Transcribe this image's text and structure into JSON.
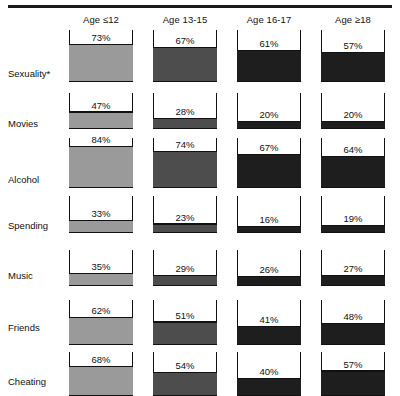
{
  "chart_data": {
    "type": "bar",
    "title": "",
    "subtitle": "",
    "xlabel": "",
    "ylabel": "",
    "ylim": [
      0,
      100
    ],
    "grid": false,
    "legend": "none",
    "note": "Small-multiples tank chart: each cell is an open-topped vessel filled from the bottom to the stated percentage.",
    "categories": [
      "Age ≤12",
      "Age 13-15",
      "Age 16-17",
      "Age ≥18"
    ],
    "row_labels": [
      "Sexuality*",
      "Movies",
      "Alcohol",
      "Spending",
      "Music",
      "Friends",
      "Cheating"
    ],
    "series": [
      {
        "name": "Sexuality*",
        "values": [
          73,
          67,
          61,
          57
        ]
      },
      {
        "name": "Movies",
        "values": [
          47,
          28,
          20,
          20
        ]
      },
      {
        "name": "Alcohol",
        "values": [
          84,
          74,
          67,
          64
        ]
      },
      {
        "name": "Spending",
        "values": [
          33,
          23,
          16,
          19
        ]
      },
      {
        "name": "Music",
        "values": [
          35,
          29,
          26,
          27
        ]
      },
      {
        "name": "Friends",
        "values": [
          62,
          51,
          41,
          48
        ]
      },
      {
        "name": "Cheating",
        "values": [
          68,
          54,
          40,
          57
        ]
      }
    ],
    "value_labels": [
      [
        "73%",
        "67%",
        "61%",
        "57%"
      ],
      [
        "47%",
        "28%",
        "20%",
        "20%"
      ],
      [
        "84%",
        "74%",
        "67%",
        "64%"
      ],
      [
        "33%",
        "23%",
        "16%",
        "19%"
      ],
      [
        "35%",
        "29%",
        "26%",
        "27%"
      ],
      [
        "62%",
        "51%",
        "41%",
        "48%"
      ],
      [
        "68%",
        "54%",
        "40%",
        "57%"
      ]
    ],
    "column_colors": [
      "#9a9a9a",
      "#4d4d4d",
      "#1e1e1e",
      "#1e1e1e"
    ],
    "outline_color": "#111111"
  },
  "header": {
    "columns": [
      {
        "label": "Age ≤12"
      },
      {
        "label": "Age 13-15"
      },
      {
        "label": "Age 16-17"
      },
      {
        "label": "Age ≥18"
      }
    ]
  },
  "rows": [
    {
      "label": "Sexuality*",
      "cells": [
        {
          "value": 73,
          "text": "73%"
        },
        {
          "value": 67,
          "text": "67%"
        },
        {
          "value": 61,
          "text": "61%"
        },
        {
          "value": 57,
          "text": "57%"
        }
      ]
    },
    {
      "label": "Movies",
      "cells": [
        {
          "value": 47,
          "text": "47%"
        },
        {
          "value": 28,
          "text": "28%"
        },
        {
          "value": 20,
          "text": "20%"
        },
        {
          "value": 20,
          "text": "20%"
        }
      ]
    },
    {
      "label": "Alcohol",
      "cells": [
        {
          "value": 84,
          "text": "84%"
        },
        {
          "value": 74,
          "text": "74%"
        },
        {
          "value": 67,
          "text": "67%"
        },
        {
          "value": 64,
          "text": "64%"
        }
      ]
    },
    {
      "label": "Spending",
      "cells": [
        {
          "value": 33,
          "text": "33%"
        },
        {
          "value": 23,
          "text": "23%"
        },
        {
          "value": 16,
          "text": "16%"
        },
        {
          "value": 19,
          "text": "19%"
        }
      ]
    },
    {
      "label": "Music",
      "cells": [
        {
          "value": 35,
          "text": "35%"
        },
        {
          "value": 29,
          "text": "29%"
        },
        {
          "value": 26,
          "text": "26%"
        },
        {
          "value": 27,
          "text": "27%"
        }
      ]
    },
    {
      "label": "Friends",
      "cells": [
        {
          "value": 62,
          "text": "62%"
        },
        {
          "value": 51,
          "text": "51%"
        },
        {
          "value": 41,
          "text": "41%"
        },
        {
          "value": 48,
          "text": "48%"
        }
      ]
    },
    {
      "label": "Cheating",
      "cells": [
        {
          "value": 68,
          "text": "68%"
        },
        {
          "value": 54,
          "text": "54%"
        },
        {
          "value": 40,
          "text": "40%"
        },
        {
          "value": 57,
          "text": "57%"
        }
      ]
    }
  ],
  "layout": {
    "column_x": [
      69,
      153,
      237,
      321
    ],
    "column_w": 64,
    "header_y": 16,
    "row_top": [
      30,
      93,
      138,
      196,
      250,
      300,
      352
    ],
    "row_tank_h": [
      52,
      36,
      50,
      37,
      36,
      45,
      44
    ],
    "label_y": [
      68,
      118,
      174,
      220,
      270,
      322,
      376
    ]
  }
}
